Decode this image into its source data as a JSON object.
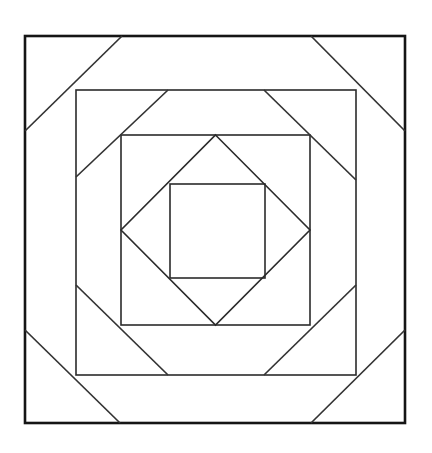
{
  "figure": {
    "type": "line-drawing",
    "canvas": {
      "width": 432,
      "height": 453,
      "background": "#ffffff"
    },
    "stroke": {
      "outer_color": "#151515",
      "inner_color": "#333333",
      "outer_width": 2.6,
      "inner_width": 1.5,
      "fill": "none"
    },
    "squares": [
      {
        "name": "outer-square",
        "x1": 25,
        "y1": 36,
        "x2": 405,
        "y2": 423,
        "stroke_width": 2.6,
        "color": "#151515"
      },
      {
        "name": "second-square",
        "x1": 76,
        "y1": 90,
        "x2": 356,
        "y2": 375,
        "stroke_width": 1.6,
        "color": "#2b2b2b"
      },
      {
        "name": "third-square",
        "x1": 121,
        "y1": 135,
        "x2": 310,
        "y2": 325,
        "stroke_width": 1.6,
        "color": "#2b2b2b"
      },
      {
        "name": "inner-square",
        "x1": 170,
        "y1": 184,
        "x2": 265,
        "y2": 278,
        "stroke_width": 1.6,
        "color": "#2b2b2b"
      }
    ],
    "diamond": {
      "name": "center-diamond",
      "points": "215.5,135 310,230 215.5,325 121,230",
      "inscribed_in": "third-square",
      "stroke_width": 1.6,
      "color": "#2b2b2b"
    },
    "corner_diagonals": [
      {
        "name": "outer-ring-diagonal-top-left",
        "x1": 25,
        "y1": 131,
        "x2": 122,
        "y2": 36
      },
      {
        "name": "outer-ring-diagonal-top-right",
        "x1": 311,
        "y1": 36,
        "x2": 405,
        "y2": 131
      },
      {
        "name": "outer-ring-diagonal-bottom-right",
        "x1": 405,
        "y1": 330,
        "x2": 311,
        "y2": 423
      },
      {
        "name": "outer-ring-diagonal-bottom-left",
        "x1": 120,
        "y1": 423,
        "x2": 25,
        "y2": 330
      },
      {
        "name": "second-ring-diagonal-top-left",
        "x1": 76,
        "y1": 177,
        "x2": 168,
        "y2": 90
      },
      {
        "name": "second-ring-diagonal-top-right",
        "x1": 264,
        "y1": 90,
        "x2": 356,
        "y2": 180
      },
      {
        "name": "second-ring-diagonal-bottom-right",
        "x1": 356,
        "y1": 285,
        "x2": 264,
        "y2": 375
      },
      {
        "name": "second-ring-diagonal-bottom-left",
        "x1": 168,
        "y1": 375,
        "x2": 76,
        "y2": 285
      }
    ],
    "counts": {
      "squares": 4,
      "diamonds": 1,
      "diagonals": 8
    }
  }
}
